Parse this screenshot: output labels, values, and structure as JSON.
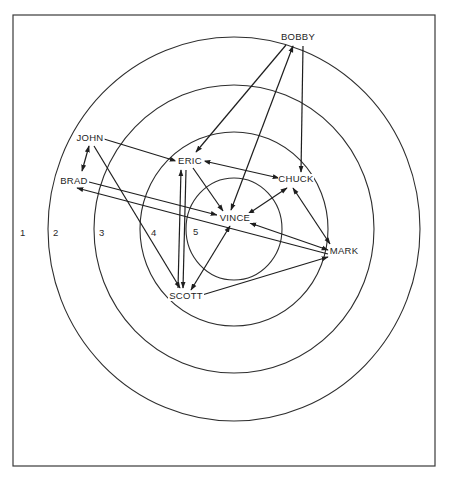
{
  "diagram": {
    "type": "sociogram-target",
    "frame": {
      "x": 13,
      "y": 15,
      "width": 422,
      "height": 451
    },
    "center": {
      "x": 234,
      "y": 229
    },
    "rings": [
      {
        "id": 1,
        "rx": 186,
        "ry": 192
      },
      {
        "id": 2,
        "rx": 140,
        "ry": 144
      },
      {
        "id": 3,
        "rx": 94,
        "ry": 97
      },
      {
        "id": 4,
        "rx": 48,
        "ry": 51
      }
    ],
    "ring_labels": [
      {
        "text": "1",
        "x": 20,
        "y": 236
      },
      {
        "text": "2",
        "x": 53,
        "y": 236
      },
      {
        "text": "3",
        "x": 99,
        "y": 236
      },
      {
        "text": "4",
        "x": 151,
        "y": 236
      },
      {
        "text": "5",
        "x": 193,
        "y": 235
      }
    ],
    "nodes": [
      {
        "id": "bobby",
        "label": "BOBBY",
        "x": 298,
        "y": 40
      },
      {
        "id": "john",
        "label": "JOHN",
        "x": 90,
        "y": 141
      },
      {
        "id": "eric",
        "label": "ERIC",
        "x": 190,
        "y": 164
      },
      {
        "id": "brad",
        "label": "BRAD",
        "x": 74,
        "y": 184
      },
      {
        "id": "chuck",
        "label": "CHUCK",
        "x": 296,
        "y": 182
      },
      {
        "id": "vince",
        "label": "VINCE",
        "x": 235,
        "y": 221
      },
      {
        "id": "mark",
        "label": "MARK",
        "x": 344,
        "y": 254
      },
      {
        "id": "scott",
        "label": "SCOTT",
        "x": 186,
        "y": 299
      }
    ],
    "edges": [
      {
        "from": "bobby",
        "to": "eric",
        "x1": 286,
        "y1": 45,
        "x2": 196,
        "y2": 152,
        "head_end": true,
        "head_start": false
      },
      {
        "from": "vince",
        "to": "bobby",
        "x1": 231,
        "y1": 210,
        "x2": 293,
        "y2": 46,
        "head_end": true,
        "head_start": true
      },
      {
        "from": "bobby",
        "to": "chuck",
        "x1": 303,
        "y1": 46,
        "x2": 301,
        "y2": 172,
        "head_end": true,
        "head_start": false
      },
      {
        "from": "john",
        "to": "eric",
        "x1": 104,
        "y1": 139,
        "x2": 176,
        "y2": 161,
        "head_end": true,
        "head_start": false
      },
      {
        "from": "john",
        "to": "brad",
        "x1": 89,
        "y1": 146,
        "x2": 82,
        "y2": 171,
        "head_end": true,
        "head_start": true
      },
      {
        "from": "john",
        "to": "scott",
        "x1": 94,
        "y1": 146,
        "x2": 180,
        "y2": 288,
        "head_end": true,
        "head_start": false
      },
      {
        "from": "brad",
        "to": "vince",
        "x1": 89,
        "y1": 182,
        "x2": 217,
        "y2": 215,
        "head_end": true,
        "head_start": false
      },
      {
        "from": "mark",
        "to": "brad",
        "x1": 328,
        "y1": 254,
        "x2": 77,
        "y2": 188,
        "head_end": true,
        "head_start": false
      },
      {
        "from": "eric",
        "to": "chuck",
        "x1": 204,
        "y1": 161,
        "x2": 279,
        "y2": 178,
        "head_end": true,
        "head_start": true
      },
      {
        "from": "eric",
        "to": "vince",
        "x1": 193,
        "y1": 168,
        "x2": 223,
        "y2": 211,
        "head_end": true,
        "head_start": false
      },
      {
        "from": "eric",
        "to": "scott",
        "x1": 186,
        "y1": 170,
        "x2": 183,
        "y2": 288,
        "head_end": true,
        "head_start": false
      },
      {
        "from": "scott",
        "to": "eric",
        "x1": 178,
        "y1": 288,
        "x2": 181,
        "y2": 170,
        "head_end": true,
        "head_start": false
      },
      {
        "from": "chuck",
        "to": "vince",
        "x1": 287,
        "y1": 188,
        "x2": 248,
        "y2": 214,
        "head_end": true,
        "head_start": true
      },
      {
        "from": "chuck",
        "to": "mark",
        "x1": 293,
        "y1": 188,
        "x2": 330,
        "y2": 244,
        "head_end": true,
        "head_start": true
      },
      {
        "from": "vince",
        "to": "mark",
        "x1": 250,
        "y1": 223,
        "x2": 328,
        "y2": 250,
        "head_end": true,
        "head_start": true
      },
      {
        "from": "scott",
        "to": "vince",
        "x1": 191,
        "y1": 290,
        "x2": 230,
        "y2": 226,
        "head_end": true,
        "head_start": true
      },
      {
        "from": "scott",
        "to": "mark",
        "x1": 202,
        "y1": 295,
        "x2": 328,
        "y2": 257,
        "head_end": true,
        "head_start": false
      }
    ],
    "colors": {
      "line": "#1e1e1e",
      "background": "#ffffff"
    }
  }
}
